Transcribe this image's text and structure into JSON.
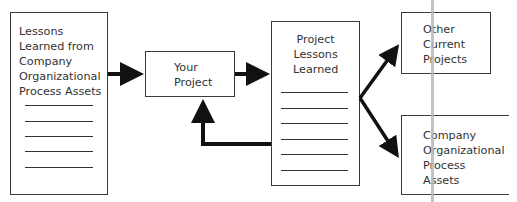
{
  "diagram": {
    "nodes": {
      "company_opa_source": {
        "label": "Lessons\nLearned from\nCompany\nOrganizational\nProcess Assets",
        "ruled_lines": 5
      },
      "your_project": {
        "label": "Your\nProject"
      },
      "project_lessons_learned": {
        "label": "Project\nLessons\nLearned",
        "ruled_lines": 6
      },
      "other_current_projects": {
        "label": "Other\nCurrent\nProjects"
      },
      "company_opa_target": {
        "label": "Company\nOrganizational\nProcess\nAssets"
      }
    },
    "edges": [
      {
        "from": "company_opa_source",
        "to": "your_project"
      },
      {
        "from": "your_project",
        "to": "project_lessons_learned"
      },
      {
        "from": "project_lessons_learned",
        "to": "your_project"
      },
      {
        "from": "project_lessons_learned",
        "to": "other_current_projects"
      },
      {
        "from": "project_lessons_learned",
        "to": "company_opa_target"
      }
    ]
  }
}
